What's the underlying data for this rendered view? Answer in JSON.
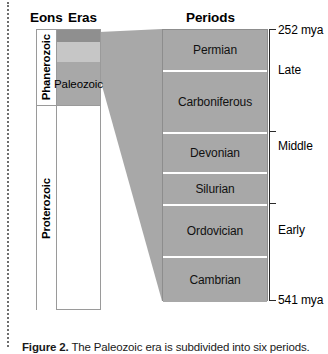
{
  "figure": {
    "headings": {
      "eons": "Eons",
      "eras": "Eras",
      "periods": "Periods"
    },
    "eons": [
      {
        "label": "Phanerozoic"
      },
      {
        "label": "Proterozoic"
      }
    ],
    "eras": [
      {
        "label": "",
        "name": "cenozoic-band",
        "color": "#8f8f8f"
      },
      {
        "label": "",
        "name": "mesozoic-band",
        "color": "#c6c6c6"
      },
      {
        "label": "Paleozoic",
        "name": "paleozoic-band",
        "color": "#a8a8a8"
      }
    ],
    "periods": [
      {
        "label": "Permian"
      },
      {
        "label": "Carboniferous"
      },
      {
        "label": "Devonian"
      },
      {
        "label": "Silurian"
      },
      {
        "label": "Ordovician"
      },
      {
        "label": "Cambrian"
      }
    ],
    "scale": {
      "top_age": "252 mya",
      "bottom_age": "541 mya",
      "epochs": [
        {
          "label": "Late"
        },
        {
          "label": "Middle"
        },
        {
          "label": "Early"
        }
      ]
    },
    "caption": {
      "label": "Figure 2.",
      "text": " The Paleozoic era is subdivided into six periods."
    },
    "colors": {
      "period_fill": "#a8a8a8",
      "connector_fill": "#a8a8a8",
      "rule": "#9a9a9a",
      "bracket": "#2a2a2a"
    }
  }
}
